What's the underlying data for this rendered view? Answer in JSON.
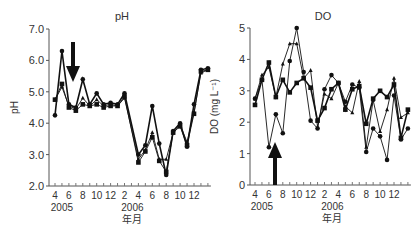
{
  "chart_data": [
    {
      "type": "line",
      "title": "pH",
      "xlabel": "年月",
      "ylabel": "pH",
      "ylim": [
        2.0,
        7.0
      ],
      "yticks": [
        "2.0",
        "3.0",
        "4.0",
        "5.0",
        "6.0",
        "7.0"
      ],
      "xtick_labels": [
        "4",
        "6",
        "8",
        "10",
        "12",
        "2",
        "4",
        "6",
        "8",
        "10",
        "12"
      ],
      "year_labels": [
        "2005",
        "2006"
      ],
      "x": [
        "2005-04",
        "2005-05",
        "2005-06",
        "2005-07",
        "2005-08",
        "2005-09",
        "2005-10",
        "2005-11",
        "2005-12",
        "2006-01",
        "2006-02",
        "2006-03",
        "2006-04",
        "2006-05",
        "2006-06",
        "2006-07",
        "2006-08",
        "2006-09",
        "2006-10",
        "2006-11",
        "2006-12",
        "2007-01"
      ],
      "annotation": "downward arrow at 2005-07",
      "series": [
        {
          "name": "circle",
          "marker": "circle",
          "values": [
            4.25,
            6.3,
            4.6,
            4.5,
            5.4,
            4.6,
            4.95,
            4.6,
            4.65,
            4.6,
            4.95,
            null,
            3.0,
            3.3,
            4.55,
            3.35,
            2.35,
            3.75,
            4.0,
            3.25,
            4.6,
            5.7,
            5.75
          ]
        },
        {
          "name": "triangle",
          "marker": "triangle",
          "values": [
            4.75,
            5.15,
            4.55,
            4.45,
            4.8,
            4.55,
            4.75,
            4.55,
            4.6,
            4.55,
            4.8,
            null,
            2.85,
            3.15,
            3.7,
            2.85,
            2.85,
            3.7,
            3.95,
            3.4,
            4.35,
            5.6,
            5.7
          ]
        },
        {
          "name": "square",
          "marker": "square",
          "values": [
            4.75,
            5.25,
            4.5,
            4.4,
            4.6,
            4.55,
            4.6,
            4.5,
            4.55,
            4.55,
            4.85,
            null,
            2.75,
            3.1,
            3.55,
            2.8,
            2.45,
            3.7,
            3.9,
            3.3,
            4.3,
            5.65,
            5.7
          ]
        }
      ]
    },
    {
      "type": "line",
      "title": "DO",
      "xlabel": "年月",
      "ylabel": "DO (mg L⁻¹)",
      "ylim": [
        0,
        5
      ],
      "yticks": [
        "0",
        "1",
        "2",
        "3",
        "4",
        "5"
      ],
      "xtick_labels": [
        "4",
        "6",
        "8",
        "10",
        "12",
        "2",
        "4",
        "6",
        "8",
        "10",
        "12"
      ],
      "year_labels": [
        "2005",
        "2006"
      ],
      "x": [
        "2005-04",
        "2005-05",
        "2005-06",
        "2005-07",
        "2005-08",
        "2005-09",
        "2005-10",
        "2005-11",
        "2005-12",
        "2006-01",
        "2006-02",
        "2006-03",
        "2006-04",
        "2006-05",
        "2006-06",
        "2006-07",
        "2006-08",
        "2006-09",
        "2006-10",
        "2006-11",
        "2006-12",
        "2007-01"
      ],
      "annotation": "upward arrow at 2005-07",
      "series": [
        {
          "name": "square",
          "marker": "square",
          "values": [
            2.55,
            3.35,
            3.9,
            2.8,
            3.35,
            2.95,
            3.25,
            3.4,
            3.1,
            2.05,
            2.45,
            3.05,
            3.25,
            2.4,
            3.05,
            3.15,
            1.95,
            2.75,
            3.0,
            2.8,
            3.2,
            1.5,
            2.4
          ]
        },
        {
          "name": "circle",
          "marker": "circle",
          "values": [
            2.75,
            3.35,
            1.2,
            2.25,
            1.65,
            3.95,
            5.0,
            3.6,
            2.05,
            1.8,
            3.05,
            3.5,
            3.25,
            2.65,
            3.2,
            3.1,
            1.05,
            1.8,
            1.55,
            0.8,
            2.85,
            1.45,
            1.8
          ]
        },
        {
          "name": "triangle",
          "marker": "triangle",
          "values": [
            2.75,
            3.5,
            3.75,
            2.8,
            3.85,
            4.5,
            4.5,
            3.4,
            3.65,
            1.85,
            2.9,
            2.75,
            3.25,
            2.5,
            2.3,
            3.3,
            1.2,
            2.7,
            1.7,
            2.4,
            3.4,
            2.15,
            2.3
          ]
        }
      ]
    }
  ]
}
